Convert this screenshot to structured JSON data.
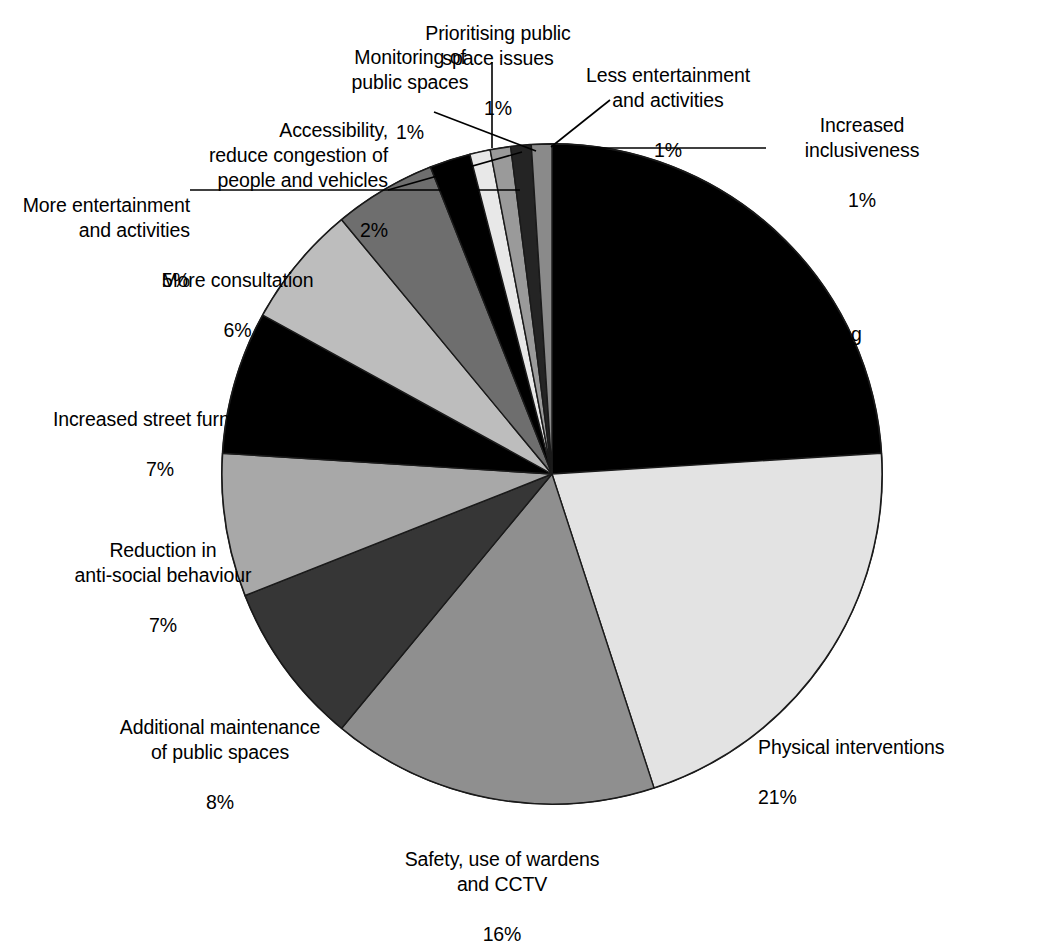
{
  "chart_data": {
    "type": "pie",
    "title": "",
    "subtitle": "",
    "xlabel": "",
    "ylabel": "",
    "legend_position": "none",
    "grid": false,
    "units": "percent",
    "total": 100,
    "start_angle_deg": 0,
    "direction": "clockwise",
    "categories": [
      "Additional cleaning of public spaces",
      "Physical interventions",
      "Safety, use of wardens and CCTV",
      "Additional maintenance of public spaces",
      "Reduction in anti-social behaviour",
      "Increased street furniture",
      "More consultation",
      "More entertainment and activities",
      "Accessibility, reduce congestion of people and vehicles",
      "Monitoring of public spaces",
      "Prioritising public space issues",
      "Less entertainment and activities",
      "Increased inclusiveness"
    ],
    "values": [
      24,
      21,
      16,
      8,
      7,
      7,
      6,
      5,
      2,
      1,
      1,
      1,
      1
    ],
    "slices": [
      {
        "id": "additional-cleaning",
        "label_lines": [
          "Additional cleaning",
          "of public spaces"
        ],
        "percent_text": "24%",
        "value": 24,
        "color": "#000000"
      },
      {
        "id": "physical-interventions",
        "label_lines": [
          "Physical interventions"
        ],
        "percent_text": "21%",
        "value": 21,
        "color": "#e3e3e3"
      },
      {
        "id": "safety-wardens-cctv",
        "label_lines": [
          "Safety, use of wardens",
          "and CCTV"
        ],
        "percent_text": "16%",
        "value": 16,
        "color": "#8f8f8f"
      },
      {
        "id": "additional-maintenance",
        "label_lines": [
          "Additional maintenance",
          "of public spaces"
        ],
        "percent_text": "8%",
        "value": 8,
        "color": "#363636"
      },
      {
        "id": "reduction-anti-social-behaviour",
        "label_lines": [
          "Reduction in",
          "anti-social behaviour"
        ],
        "percent_text": "7%",
        "value": 7,
        "color": "#a8a8a8"
      },
      {
        "id": "increased-street-furniture",
        "label_lines": [
          "Increased street furniture"
        ],
        "percent_text": "7%",
        "value": 7,
        "color": "#000000"
      },
      {
        "id": "more-consultation",
        "label_lines": [
          "More consultation"
        ],
        "percent_text": "6%",
        "value": 6,
        "color": "#bdbdbd"
      },
      {
        "id": "more-entertainment-activities",
        "label_lines": [
          "More entertainment",
          "and activities"
        ],
        "percent_text": "5%",
        "value": 5,
        "color": "#6e6e6e"
      },
      {
        "id": "accessibility-reduce-congestion",
        "label_lines": [
          "Accessibility,",
          "reduce congestion of",
          "people and vehicles"
        ],
        "percent_text": "2%",
        "value": 2,
        "color": "#000000"
      },
      {
        "id": "monitoring-public-spaces",
        "label_lines": [
          "Monitoring of",
          "public spaces"
        ],
        "percent_text": "1%",
        "value": 1,
        "color": "#e8e8e8"
      },
      {
        "id": "prioritising-public-space-issues",
        "label_lines": [
          "Prioritising public",
          "space issues"
        ],
        "percent_text": "1%",
        "value": 1,
        "color": "#9a9a9a"
      },
      {
        "id": "less-entertainment-activities",
        "label_lines": [
          "Less entertainment",
          "and activities"
        ],
        "percent_text": "1%",
        "value": 1,
        "color": "#242424"
      },
      {
        "id": "increased-inclusiveness",
        "label_lines": [
          "Increased",
          "inclusiveness"
        ],
        "percent_text": "1%",
        "value": 1,
        "color": "#8a8a8a"
      }
    ]
  },
  "labels": {
    "additional_cleaning": "Additional cleaning\nof public spaces",
    "additional_cleaning_pct": "24%",
    "physical_interventions": "Physical interventions",
    "physical_interventions_pct": "21%",
    "safety_wardens_cctv": "Safety, use of wardens\nand CCTV",
    "safety_wardens_cctv_pct": "16%",
    "additional_maintenance": "Additional maintenance\nof public spaces",
    "additional_maintenance_pct": "8%",
    "reduction_anti_social": "Reduction in\nanti-social behaviour",
    "reduction_anti_social_pct": "7%",
    "increased_street_furniture": "Increased street furniture",
    "increased_street_furniture_pct": "7%",
    "more_consultation": "More consultation",
    "more_consultation_pct": "6%",
    "more_entertainment": "More entertainment\nand activities",
    "more_entertainment_pct": "5%",
    "accessibility": "Accessibility,\nreduce congestion of\npeople and vehicles",
    "accessibility_pct": "2%",
    "monitoring": "Monitoring of\npublic spaces",
    "monitoring_pct": "1%",
    "prioritising": "Prioritising public\nspace issues",
    "prioritising_pct": "1%",
    "less_entertainment": "Less entertainment\nand activities",
    "less_entertainment_pct": "1%",
    "increased_inclusiveness": "Increased\ninclusiveness",
    "increased_inclusiveness_pct": "1%"
  }
}
